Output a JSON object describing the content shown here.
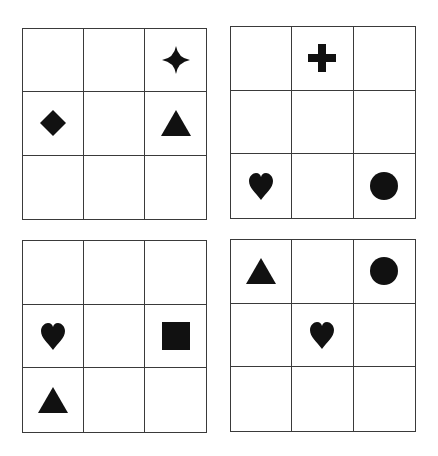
{
  "figure": {
    "symbol_color": "#111111",
    "line_color": "#3a3a3a",
    "grids": [
      {
        "id": "top-left",
        "box": {
          "left": 22,
          "top": 28,
          "width": 185,
          "height": 192
        },
        "cells": [
          [
            "",
            "",
            "star4"
          ],
          [
            "diamond",
            "",
            "triangle"
          ],
          [
            "",
            "",
            ""
          ]
        ]
      },
      {
        "id": "top-right",
        "box": {
          "left": 230,
          "top": 26,
          "width": 186,
          "height": 193
        },
        "cells": [
          [
            "",
            "plus",
            ""
          ],
          [
            "",
            "",
            ""
          ],
          [
            "heart",
            "",
            "circle"
          ]
        ]
      },
      {
        "id": "bottom-left",
        "box": {
          "left": 22,
          "top": 240,
          "width": 185,
          "height": 193
        },
        "cells": [
          [
            "",
            "",
            ""
          ],
          [
            "heart",
            "",
            "square"
          ],
          [
            "triangle",
            "",
            ""
          ]
        ]
      },
      {
        "id": "bottom-right",
        "box": {
          "left": 230,
          "top": 239,
          "width": 186,
          "height": 193
        },
        "cells": [
          [
            "triangle",
            "",
            "circle"
          ],
          [
            "",
            "heart",
            ""
          ],
          [
            "",
            "",
            ""
          ]
        ]
      }
    ]
  }
}
